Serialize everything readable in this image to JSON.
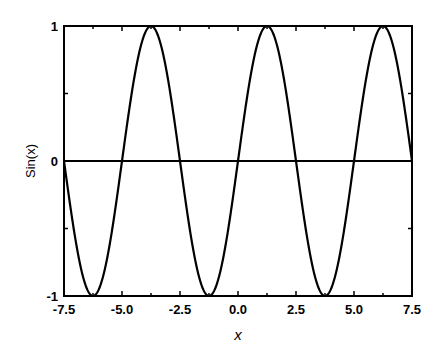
{
  "chart_data": {
    "type": "line",
    "title": "",
    "xlabel": "x",
    "ylabel": "Sin(x)",
    "xlim": [
      -7.5,
      7.5
    ],
    "ylim": [
      -1,
      1
    ],
    "x_ticks": [
      "-7.5",
      "-5.0",
      "-2.5",
      "0.0",
      "2.5",
      "5.0",
      "7.5"
    ],
    "x_tick_values": [
      -7.5,
      -5.0,
      -2.5,
      0.0,
      2.5,
      5.0,
      7.5
    ],
    "y_ticks": [
      "-1",
      "0",
      "1"
    ],
    "y_tick_values": [
      -1,
      0,
      1
    ],
    "grid": false,
    "legend": null,
    "reference_line": {
      "y": 0
    },
    "series": [
      {
        "name": "Sin(x)",
        "color": "#000000",
        "period": 5,
        "phase_note": "zero crossings at -7.5, -5.0, -2.5, 0.0, 2.5, 5.0, 7.5; starts descending at -7.5",
        "x": [
          -7.5,
          -6.25,
          -5.0,
          -3.75,
          -2.5,
          -1.25,
          0.0,
          1.25,
          2.5,
          3.75,
          5.0,
          6.25,
          7.5
        ],
        "values": [
          0,
          -1,
          0,
          1,
          0,
          -1,
          0,
          1,
          0,
          -1,
          0,
          1,
          0
        ]
      }
    ]
  },
  "plot": {
    "left": 64,
    "right": 412,
    "top": 26,
    "bottom": 296
  }
}
